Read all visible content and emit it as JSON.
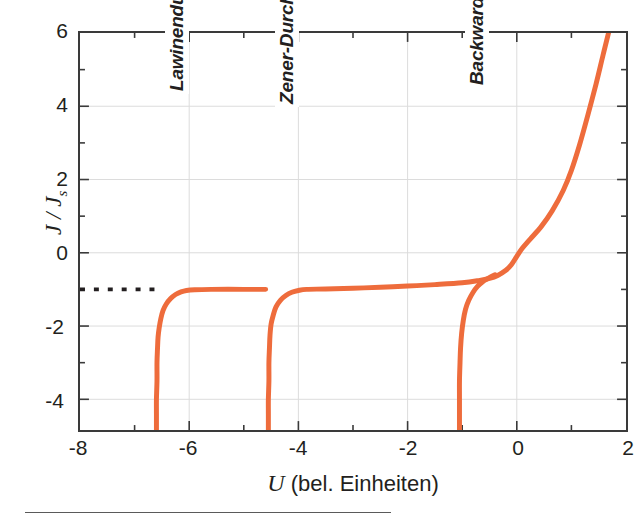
{
  "chart_data": {
    "type": "line",
    "title": "",
    "xlabel": "U (bel. Einheiten)",
    "ylabel": "J / Js",
    "ylabel_main": "J / J",
    "ylabel_sub": "s",
    "xlim": [
      -8,
      2
    ],
    "ylim": [
      -4.84,
      6
    ],
    "xticks": [
      -8,
      -6,
      -4,
      -2,
      0,
      2
    ],
    "xtick_labels": [
      "-8",
      "-6",
      "-4",
      "-2",
      "0",
      "2"
    ],
    "yticks": [
      -4,
      -2,
      0,
      2,
      4,
      6
    ],
    "ytick_labels": [
      "-4",
      "-2",
      "0",
      "2",
      "4",
      "6"
    ],
    "x_minor_step": 1,
    "y_minor_step": 1,
    "grid": true,
    "grid_color": "#d8d8d8",
    "legend": "none",
    "curve_color": "#ee6c3c",
    "curve_width": 5,
    "axis_color": "#3a3a3a",
    "saturation_level": -1,
    "annotations": [
      {
        "label": "Lawinendurchbruch",
        "x": -6.45,
        "y": 4.35,
        "rotation": -90
      },
      {
        "label": "Zener-Durchbruch",
        "x": -4.45,
        "y": 4.0,
        "rotation": -90
      },
      {
        "label": "Backward-Diode",
        "x": -1.0,
        "y": 4.5,
        "rotation": -90
      }
    ],
    "dotted_reference": {
      "label": "",
      "y": -1,
      "x_start": -8,
      "x_end": -6.6,
      "color": "#231f20",
      "style": "dotted"
    },
    "series": [
      {
        "name": "Lawinendurchbruch (avalanche breakdown branch)",
        "breakdown_voltage": -6.6,
        "values_xy": [
          [
            -6.6,
            -4.84
          ],
          [
            -6.6,
            -4.4
          ],
          [
            -6.6,
            -4.0
          ],
          [
            -6.59,
            -3.5
          ],
          [
            -6.59,
            -3.0
          ],
          [
            -6.58,
            -2.6
          ],
          [
            -6.57,
            -2.3
          ],
          [
            -6.55,
            -2.05
          ],
          [
            -6.52,
            -1.8
          ],
          [
            -6.48,
            -1.58
          ],
          [
            -6.42,
            -1.4
          ],
          [
            -6.34,
            -1.25
          ],
          [
            -6.25,
            -1.14
          ],
          [
            -6.15,
            -1.07
          ],
          [
            -6.05,
            -1.03
          ],
          [
            -5.9,
            -1.01
          ],
          [
            -5.6,
            -1.0
          ],
          [
            -5.0,
            -1.0
          ],
          [
            -4.6,
            -1.0
          ]
        ]
      },
      {
        "name": "Zener-Durchbruch (Zener breakdown branch)",
        "breakdown_voltage": -4.55,
        "values_xy": [
          [
            -4.55,
            -4.84
          ],
          [
            -4.55,
            -4.4
          ],
          [
            -4.55,
            -4.0
          ],
          [
            -4.54,
            -3.5
          ],
          [
            -4.54,
            -3.0
          ],
          [
            -4.53,
            -2.6
          ],
          [
            -4.52,
            -2.25
          ],
          [
            -4.5,
            -1.95
          ],
          [
            -4.46,
            -1.7
          ],
          [
            -4.41,
            -1.48
          ],
          [
            -4.33,
            -1.3
          ],
          [
            -4.23,
            -1.17
          ],
          [
            -4.12,
            -1.08
          ],
          [
            -4.0,
            -1.03
          ],
          [
            -3.85,
            -1.0
          ],
          [
            -3.5,
            -0.99
          ],
          [
            -3.0,
            -0.97
          ],
          [
            -2.5,
            -0.94
          ],
          [
            -2.0,
            -0.91
          ],
          [
            -1.5,
            -0.87
          ],
          [
            -1.0,
            -0.82
          ],
          [
            -0.7,
            -0.76
          ],
          [
            -0.5,
            -0.7
          ],
          [
            -0.35,
            -0.62
          ],
          [
            -0.2,
            -0.48
          ],
          [
            -0.1,
            -0.33
          ],
          [
            0.0,
            -0.1
          ],
          [
            0.1,
            0.12
          ],
          [
            0.25,
            0.38
          ],
          [
            0.45,
            0.72
          ],
          [
            0.65,
            1.15
          ],
          [
            0.85,
            1.7
          ],
          [
            1.0,
            2.25
          ],
          [
            1.15,
            2.95
          ],
          [
            1.3,
            3.75
          ],
          [
            1.45,
            4.6
          ],
          [
            1.58,
            5.4
          ],
          [
            1.68,
            6.0
          ]
        ]
      },
      {
        "name": "Backward-Diode branch",
        "breakdown_voltage": -1.05,
        "values_xy": [
          [
            -1.05,
            -4.84
          ],
          [
            -1.05,
            -4.4
          ],
          [
            -1.05,
            -4.0
          ],
          [
            -1.05,
            -3.5
          ],
          [
            -1.04,
            -3.0
          ],
          [
            -1.03,
            -2.6
          ],
          [
            -1.01,
            -2.2
          ],
          [
            -0.98,
            -1.85
          ],
          [
            -0.94,
            -1.55
          ],
          [
            -0.88,
            -1.3
          ],
          [
            -0.8,
            -1.08
          ],
          [
            -0.72,
            -0.92
          ],
          [
            -0.63,
            -0.8
          ],
          [
            -0.55,
            -0.72
          ],
          [
            -0.48,
            -0.66
          ],
          [
            -0.4,
            -0.6
          ]
        ]
      }
    ]
  },
  "axes": {
    "x_title": "U (bel. Einheiten)",
    "x_title_italic": "U",
    "x_title_rest": " (bel. Einheiten)",
    "y_title_main": "J / J",
    "y_title_sub": "s"
  },
  "tick_labels": {
    "x": [
      "-8",
      "-6",
      "-4",
      "-2",
      "0",
      "2"
    ],
    "y": [
      "6",
      "4",
      "2",
      "0",
      "-2",
      "-4"
    ]
  },
  "annotations": {
    "avalanche": "Lawinendurchbruch",
    "zener": "Zener-Durchbruch",
    "backward": "Backward-Diode"
  },
  "colors": {
    "curve": "#ee6c3c",
    "axis": "#3a3a3a",
    "grid": "#d8d8d8",
    "text": "#231f20",
    "dotted": "#231f20",
    "rule": "#5a5a5a"
  }
}
